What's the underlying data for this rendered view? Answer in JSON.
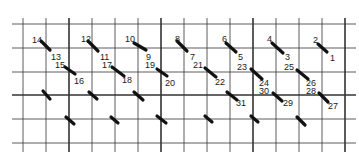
{
  "grid": {
    "vertical_lines": [
      {
        "x": 23,
        "bold": false
      },
      {
        "x": 46,
        "bold": false
      },
      {
        "x": 69,
        "bold": true
      },
      {
        "x": 92,
        "bold": false
      },
      {
        "x": 115,
        "bold": false
      },
      {
        "x": 138,
        "bold": false
      },
      {
        "x": 161,
        "bold": true
      },
      {
        "x": 184,
        "bold": false
      },
      {
        "x": 207,
        "bold": false
      },
      {
        "x": 230,
        "bold": false
      },
      {
        "x": 253,
        "bold": true
      },
      {
        "x": 276,
        "bold": false
      },
      {
        "x": 299,
        "bold": false
      },
      {
        "x": 322,
        "bold": false
      },
      {
        "x": 345,
        "bold": true
      }
    ],
    "horizontal_lines": [
      {
        "y": 24,
        "bold": false
      },
      {
        "y": 48,
        "bold": false
      },
      {
        "y": 72,
        "bold": false
      },
      {
        "y": 95,
        "bold": true
      },
      {
        "y": 119,
        "bold": false
      },
      {
        "y": 143,
        "bold": false
      }
    ],
    "x_start": 12,
    "x_end": 356,
    "y_start": 18,
    "y_end": 152,
    "line_color": "#333333"
  },
  "stitches": [
    {
      "x1": 41,
      "y1": 41,
      "x2": 50,
      "y2": 50,
      "start_label": "14",
      "end_label": "13"
    },
    {
      "x1": 88,
      "y1": 41,
      "x2": 98,
      "y2": 51,
      "start_label": "12",
      "end_label": "11"
    },
    {
      "x1": 134,
      "y1": 43,
      "x2": 146,
      "y2": 50,
      "start_label": "10",
      "end_label": "9"
    },
    {
      "x1": 177,
      "y1": 41,
      "x2": 187,
      "y2": 51,
      "start_label": "8",
      "end_label": "7"
    },
    {
      "x1": 226,
      "y1": 43,
      "x2": 236,
      "y2": 52,
      "start_label": "6",
      "end_label": "5"
    },
    {
      "x1": 272,
      "y1": 43,
      "x2": 283,
      "y2": 53,
      "start_label": "4",
      "end_label": "3"
    },
    {
      "x1": 318,
      "y1": 44,
      "x2": 327,
      "y2": 52,
      "start_label": "2",
      "end_label": "1"
    },
    {
      "x1": 65,
      "y1": 67,
      "x2": 75,
      "y2": 74,
      "start_label": "15",
      "end_label": "16"
    },
    {
      "x1": 112,
      "y1": 67,
      "x2": 124,
      "y2": 76,
      "start_label": "17",
      "end_label": "18"
    },
    {
      "x1": 157,
      "y1": 69,
      "x2": 167,
      "y2": 76,
      "start_label": "19",
      "end_label": "20"
    },
    {
      "x1": 205,
      "y1": 68,
      "x2": 216,
      "y2": 77,
      "start_label": "21",
      "end_label": "22"
    },
    {
      "x1": 251,
      "y1": 69,
      "x2": 262,
      "y2": 79,
      "start_label": "23",
      "end_label": "24"
    },
    {
      "x1": 297,
      "y1": 70,
      "x2": 308,
      "y2": 79,
      "start_label": "25",
      "end_label": "26"
    },
    {
      "x1": 43,
      "y1": 91,
      "x2": 50,
      "y2": 99,
      "start_label": "",
      "end_label": ""
    },
    {
      "x1": 89,
      "y1": 92,
      "x2": 97,
      "y2": 99,
      "start_label": "",
      "end_label": ""
    },
    {
      "x1": 134,
      "y1": 92,
      "x2": 143,
      "y2": 100,
      "start_label": "",
      "end_label": ""
    },
    {
      "x1": 227,
      "y1": 92,
      "x2": 237,
      "y2": 100,
      "start_label": "",
      "end_label": "31"
    },
    {
      "x1": 273,
      "y1": 93,
      "x2": 282,
      "y2": 101,
      "start_label": "30",
      "end_label": "29"
    },
    {
      "x1": 319,
      "y1": 93,
      "x2": 328,
      "y2": 102,
      "start_label": "28",
      "end_label": "27"
    },
    {
      "x1": 66,
      "y1": 117,
      "x2": 74,
      "y2": 124,
      "start_label": "",
      "end_label": ""
    },
    {
      "x1": 111,
      "y1": 117,
      "x2": 118,
      "y2": 123,
      "start_label": "",
      "end_label": ""
    },
    {
      "x1": 157,
      "y1": 116,
      "x2": 166,
      "y2": 123,
      "start_label": "",
      "end_label": ""
    },
    {
      "x1": 205,
      "y1": 116,
      "x2": 212,
      "y2": 122,
      "start_label": "",
      "end_label": ""
    },
    {
      "x1": 251,
      "y1": 116,
      "x2": 258,
      "y2": 122,
      "start_label": "",
      "end_label": ""
    },
    {
      "x1": 297,
      "y1": 117,
      "x2": 305,
      "y2": 125,
      "start_label": "",
      "end_label": ""
    }
  ],
  "labels": [
    {
      "text": "14",
      "x": 32,
      "y": 43
    },
    {
      "text": "13",
      "x": 51,
      "y": 60
    },
    {
      "text": "12",
      "x": 81,
      "y": 42
    },
    {
      "text": "11",
      "x": 100,
      "y": 60
    },
    {
      "text": "10",
      "x": 125,
      "y": 42
    },
    {
      "text": "9",
      "x": 146,
      "y": 60
    },
    {
      "text": "8",
      "x": 175,
      "y": 42
    },
    {
      "text": "7",
      "x": 190,
      "y": 60
    },
    {
      "text": "6",
      "x": 222,
      "y": 42
    },
    {
      "text": "5",
      "x": 238,
      "y": 60
    },
    {
      "text": "4",
      "x": 267,
      "y": 42
    },
    {
      "text": "3",
      "x": 285,
      "y": 60
    },
    {
      "text": "2",
      "x": 313,
      "y": 43
    },
    {
      "text": "1",
      "x": 330,
      "y": 61
    },
    {
      "text": "15",
      "x": 55,
      "y": 68
    },
    {
      "text": "16",
      "x": 74,
      "y": 84
    },
    {
      "text": "17",
      "x": 102,
      "y": 68
    },
    {
      "text": "18",
      "x": 122,
      "y": 83
    },
    {
      "text": "19",
      "x": 145,
      "y": 68
    },
    {
      "text": "20",
      "x": 165,
      "y": 86
    },
    {
      "text": "21",
      "x": 193,
      "y": 68
    },
    {
      "text": "22",
      "x": 215,
      "y": 85
    },
    {
      "text": "23",
      "x": 237,
      "y": 70
    },
    {
      "text": "24",
      "x": 259,
      "y": 86
    },
    {
      "text": "25",
      "x": 284,
      "y": 70
    },
    {
      "text": "26",
      "x": 306,
      "y": 86
    },
    {
      "text": "30",
      "x": 259,
      "y": 94
    },
    {
      "text": "28",
      "x": 306,
      "y": 94
    },
    {
      "text": "31",
      "x": 236,
      "y": 106
    },
    {
      "text": "29",
      "x": 283,
      "y": 106
    },
    {
      "text": "27",
      "x": 328,
      "y": 109
    }
  ]
}
